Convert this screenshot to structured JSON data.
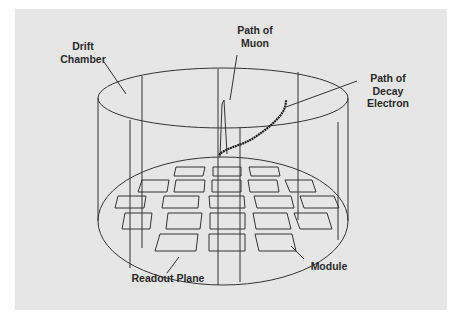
{
  "figure": {
    "background_color": "#e6e6e6",
    "line_color": "#333333",
    "labels": {
      "drift_chamber": "Drift\nChamber",
      "path_of_muon": "Path of\nMuon",
      "path_of_decay_electron": "Path of\nDecay\nElectron",
      "readout_plane": "Readout Plane",
      "module": "Module"
    },
    "components": {
      "drift_chamber": "cylinder",
      "readout_plane": "ellipse with grid of modules",
      "module_rows": [
        3,
        5,
        5,
        5,
        3
      ],
      "module_count": 21
    }
  }
}
